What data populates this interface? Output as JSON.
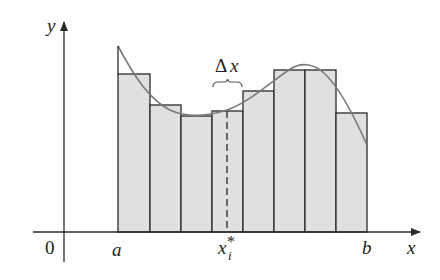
{
  "diagram": {
    "colors": {
      "background": "#ffffff",
      "rect_fill": "#e0e0e0",
      "rect_stroke": "#2a2a2a",
      "curve": "#7a7a7a",
      "axis": "#2a2a2a"
    },
    "axes": {
      "y_label": "y",
      "x_label": "x",
      "origin_label": "0"
    },
    "tick_labels": {
      "a": "a",
      "b": "b",
      "xi_base": "x",
      "xi_sub": "i",
      "xi_sup": "*"
    },
    "annotation": {
      "delta_symbol": "Δ",
      "delta_var": "x"
    },
    "rectangles": [
      {
        "x0": 118,
        "x1": 150,
        "top": 74
      },
      {
        "x0": 150,
        "x1": 181,
        "top": 105
      },
      {
        "x0": 181,
        "x1": 212,
        "top": 116
      },
      {
        "x0": 212,
        "x1": 243,
        "top": 111
      },
      {
        "x0": 243,
        "x1": 274,
        "top": 91
      },
      {
        "x0": 274,
        "x1": 305,
        "top": 70
      },
      {
        "x0": 305,
        "x1": 336,
        "top": 70
      },
      {
        "x0": 336,
        "x1": 367,
        "top": 113
      }
    ],
    "baseline_y": 232,
    "sample_line_x": 227
  }
}
